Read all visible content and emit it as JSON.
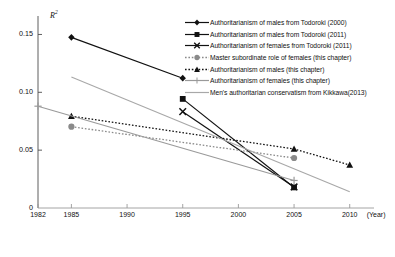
{
  "chart_data": {
    "type": "line",
    "title": "",
    "subtitle": "",
    "xlabel": "(Year)",
    "ylabel": "R2",
    "ylabel_base": "R",
    "ylabel_exp": "2",
    "xlim": [
      1982,
      2012
    ],
    "ylim": [
      0,
      0.1625
    ],
    "grid": false,
    "legend_position": "top-right",
    "x_ticks": [
      "1982",
      "1985",
      "1990",
      "1995",
      "2000",
      "2005",
      "2010"
    ],
    "x_tick_values": [
      1982,
      1985,
      1990,
      1995,
      2000,
      2005,
      2010
    ],
    "y_ticks": [
      "0",
      "0.05",
      "0.10",
      "0.15"
    ],
    "y_tick_values": [
      0,
      0.05,
      0.1,
      0.15
    ],
    "series": [
      {
        "name": "Authoritarianism of males from Todoroki (2000)",
        "marker": "diamond",
        "line": "solid",
        "color": "#111111",
        "x": [
          1985,
          1995
        ],
        "values": [
          0.1475,
          0.1122
        ]
      },
      {
        "name": "Authoritarianism of males from Todoroki (2011)",
        "marker": "square",
        "line": "solid",
        "color": "#111111",
        "x": [
          1995,
          2005
        ],
        "values": [
          0.0943,
          0.0178
        ]
      },
      {
        "name": "Authoritarianism of females from Todoroki (2011)",
        "marker": "x",
        "line": "solid",
        "color": "#111111",
        "x": [
          1995,
          2005
        ],
        "values": [
          0.0833,
          0.0182
        ]
      },
      {
        "name": "Master subordinate role of females (this chapter)",
        "marker": "circle",
        "line": "dotted",
        "color": "#8a8a8a",
        "x": [
          1985,
          2005
        ],
        "values": [
          0.0703,
          0.0432
        ]
      },
      {
        "name": "Authoritarianism of males (this chapter)",
        "marker": "triangle",
        "line": "dotted",
        "color": "#111111",
        "x": [
          1985,
          2005,
          2010
        ],
        "values": [
          0.0793,
          0.051,
          0.0372
        ]
      },
      {
        "name": "Authoritarianism of females (this chapter)",
        "marker": "plus",
        "line": "solid",
        "color": "#9a9a9a",
        "x": [
          1982,
          2005
        ],
        "values": [
          0.088,
          0.0238
        ]
      },
      {
        "name": "Men's authoritarian conservatism from Kikkawa(2013)",
        "marker": "none",
        "line": "solid",
        "color": "#a8a8a8",
        "x": [
          1985,
          2010
        ],
        "values": [
          0.1133,
          0.014
        ]
      }
    ]
  },
  "legend": {
    "items": [
      {
        "label": "Authoritarianism of males from Todoroki (2000)"
      },
      {
        "label": "Authoritarianism of males from Todoroki (2011)"
      },
      {
        "label": "Authoritarianism of females from Todoroki (2011)"
      },
      {
        "label": "Master subordinate role of females (this chapter)"
      },
      {
        "label": "Authoritarianism of males (this chapter)"
      },
      {
        "label": "Authoritarianism of females (this chapter)"
      },
      {
        "label": "Men's authoritarian conservatism from Kikkawa(2013)"
      }
    ]
  },
  "axes": {
    "y_title_base": "R",
    "y_title_exp": "2",
    "x_unit_label": "(Year)"
  }
}
